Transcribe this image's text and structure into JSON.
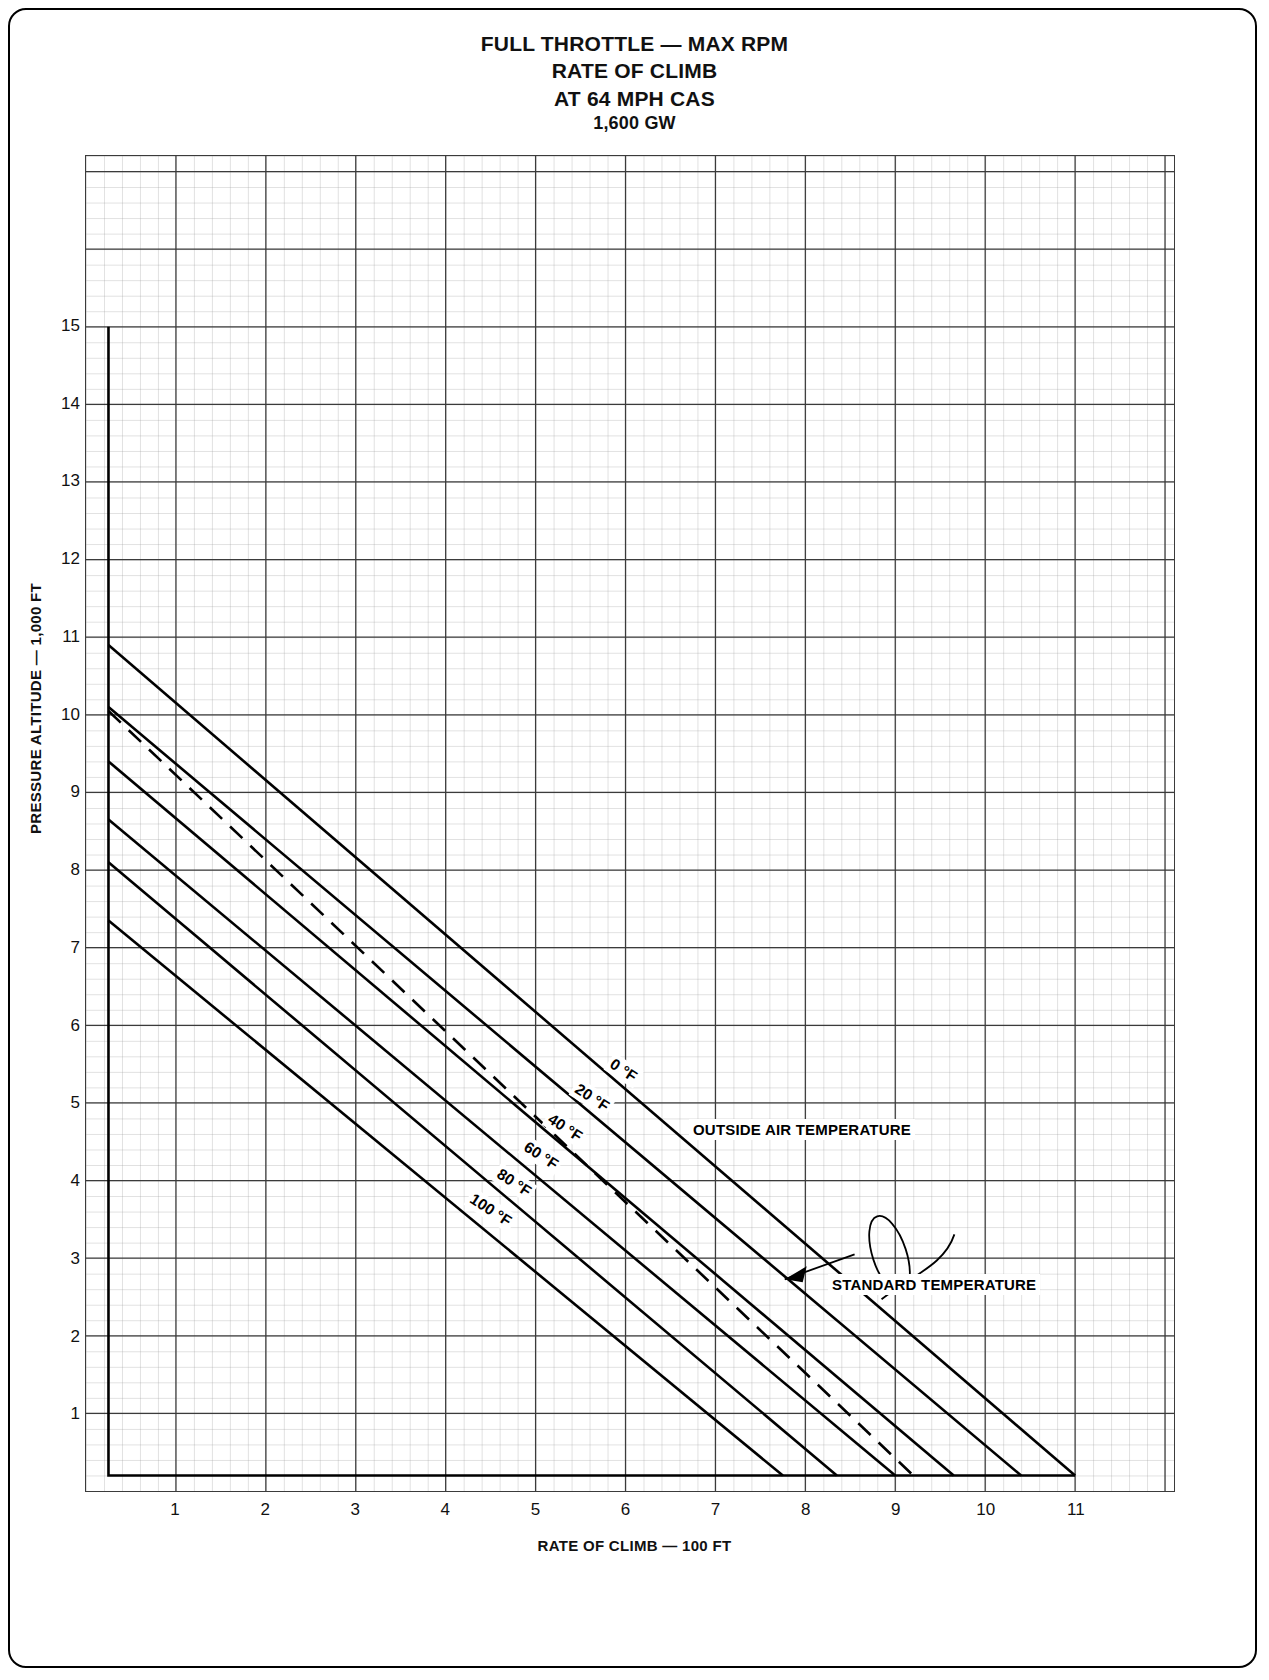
{
  "page": {
    "corner_mark": "",
    "background": "#ffffff",
    "ink": "#000000"
  },
  "title": {
    "line1": "FULL THROTTLE — MAX RPM",
    "line2": "RATE OF CLIMB",
    "line3": "AT 64 MPH CAS",
    "line4": "1,600 GW"
  },
  "axes": {
    "y_title": "PRESSURE ALTITUDE — 1,000 FT",
    "x_title": "RATE OF CLIMB — 100 FT",
    "y_ticks": [
      "1",
      "2",
      "3",
      "4",
      "5",
      "6",
      "7",
      "8",
      "9",
      "10",
      "11",
      "12",
      "13",
      "14",
      "15"
    ],
    "x_ticks": [
      "1",
      "2",
      "3",
      "4",
      "5",
      "6",
      "7",
      "8",
      "9",
      "10",
      "11"
    ]
  },
  "annotations": {
    "oat": "OUTSIDE AIR TEMPERATURE",
    "standard": "STANDARD TEMPERATURE"
  },
  "curve_labels": [
    {
      "text": "0 °F"
    },
    {
      "text": "20 °F"
    },
    {
      "text": "40 °F"
    },
    {
      "text": "60 °F"
    },
    {
      "text": "80 °F"
    },
    {
      "text": "100 °F"
    }
  ],
  "chart_data": {
    "type": "line",
    "xlabel": "RATE OF CLIMB — 100 FT",
    "ylabel": "PRESSURE ALTITUDE — 1,000 FT",
    "xlim": [
      0,
      12.1
    ],
    "ylim": [
      0,
      17.2
    ],
    "grid": true,
    "grid_major_x": 1,
    "grid_major_y": 1,
    "grid_minor": 0.2,
    "legend": "inline curve labels",
    "left_boundary_x": 0.25,
    "bottom_boundary_y": 0.2,
    "top_boundary_y": 15.0,
    "series": [
      {
        "name": "0 °F",
        "style": "solid",
        "points": [
          [
            0.25,
            10.9
          ],
          [
            11.0,
            0.2
          ]
        ]
      },
      {
        "name": "20 °F",
        "style": "solid",
        "points": [
          [
            0.25,
            10.1
          ],
          [
            10.4,
            0.2
          ]
        ]
      },
      {
        "name": "40 °F",
        "style": "solid",
        "points": [
          [
            0.25,
            9.4
          ],
          [
            9.65,
            0.2
          ]
        ]
      },
      {
        "name": "60 °F",
        "style": "solid",
        "points": [
          [
            0.25,
            8.65
          ],
          [
            9.0,
            0.2
          ]
        ]
      },
      {
        "name": "80 °F",
        "style": "solid",
        "points": [
          [
            0.25,
            8.1
          ],
          [
            8.35,
            0.2
          ]
        ]
      },
      {
        "name": "100 °F",
        "style": "solid",
        "points": [
          [
            0.25,
            7.35
          ],
          [
            7.75,
            0.2
          ]
        ]
      },
      {
        "name": "STANDARD TEMPERATURE",
        "style": "dashed",
        "points": [
          [
            0.25,
            10.05
          ],
          [
            9.2,
            0.2
          ]
        ]
      }
    ],
    "vertical_boundary": {
      "x": 0.25,
      "y_from": 0.2,
      "y_to": 15.0
    }
  }
}
